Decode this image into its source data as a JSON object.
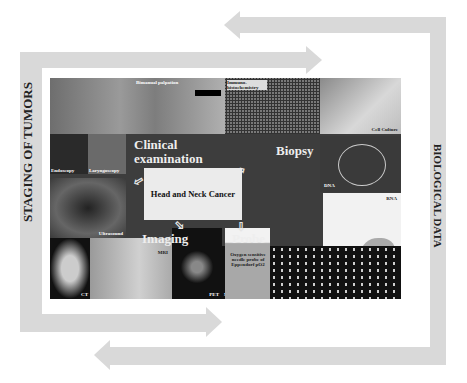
{
  "side_labels": {
    "left": "STAGING OF TUMORS",
    "right": "BIOLOGICAL DATA"
  },
  "center": {
    "title": "Head and Neck Cancer"
  },
  "categories": {
    "clinical": "Clinical examination",
    "biopsy": "Biopsy",
    "imaging": "Imaging",
    "probe": "Probe"
  },
  "image_labels": {
    "bimanual": "Bimanual palpation",
    "immuno": "Immuno-histochemistry",
    "cell_culture": "Cell Culture",
    "endoscopy": "Endoscopy",
    "laryngoscopy": "Laryngoscopy",
    "dna": "DNA",
    "rna": "RNA",
    "protein": "Protein",
    "ultrasound": "Ultrasound",
    "mri": "MRI",
    "ct": "CT",
    "pet": "PET",
    "oxygen_probe": "Oxygen sensitive needle probe of Eppendorf pO2",
    "microarray": "Microarray"
  },
  "colors": {
    "band": "#d9d9d9",
    "panel": "#3d3d3d",
    "center_box": "#ebebeb"
  }
}
